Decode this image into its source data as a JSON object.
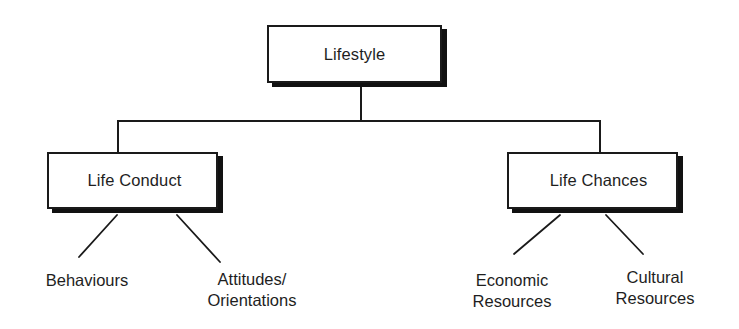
{
  "diagram": {
    "type": "hierarchy-tree",
    "root": {
      "label": "Lifestyle",
      "box": {
        "x": 267,
        "y": 25,
        "w": 175,
        "h": 58
      }
    },
    "branches": [
      {
        "label": "Life Conduct",
        "box": {
          "x": 47,
          "y": 152,
          "w": 171,
          "h": 57
        },
        "leaves": [
          {
            "lines": [
              "Behaviours"
            ],
            "cx": 87,
            "top": 268
          },
          {
            "lines": [
              "Attitudes/",
              "Orientations"
            ],
            "cx": 252,
            "top": 268
          }
        ]
      },
      {
        "label": "Life Chances",
        "box": {
          "x": 507,
          "y": 152,
          "w": 171,
          "h": 57
        },
        "leaves": [
          {
            "lines": [
              "Economic",
              "Resources"
            ],
            "cx": 512,
            "top": 269
          },
          {
            "lines": [
              "Cultural",
              "Resources"
            ],
            "cx": 655,
            "top": 266
          }
        ]
      }
    ],
    "edges": [
      {
        "from": "Lifestyle",
        "to": "Life Conduct",
        "style": "orthogonal"
      },
      {
        "from": "Lifestyle",
        "to": "Life Chances",
        "style": "orthogonal"
      },
      {
        "from": "Life Conduct",
        "to": "Behaviours",
        "style": "diagonal"
      },
      {
        "from": "Life Conduct",
        "to": "Attitudes/ Orientations",
        "style": "diagonal"
      },
      {
        "from": "Life Chances",
        "to": "Economic Resources",
        "style": "diagonal"
      },
      {
        "from": "Life Chances",
        "to": "Cultural Resources",
        "style": "diagonal"
      }
    ],
    "colors": {
      "line": "#1a1a1a",
      "shadow": "#111111",
      "background": "#ffffff",
      "text": "#1e1e1e"
    }
  }
}
